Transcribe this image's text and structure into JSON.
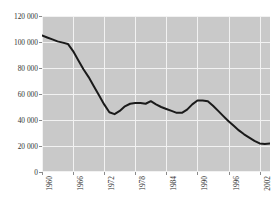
{
  "chart_data": {
    "type": "line",
    "title": "",
    "subtitle": "",
    "xlabel": "",
    "ylabel": "",
    "xlim": [
      1960,
      2004
    ],
    "ylim": [
      0,
      120000
    ],
    "grid": true,
    "legend": null,
    "legend_position": "none",
    "y_tick_labels": [
      "120 000",
      "100 000",
      "80 000",
      "60 000",
      "40 000",
      "20 000",
      "0"
    ],
    "y_tick_values": [
      120000,
      100000,
      80000,
      60000,
      40000,
      20000,
      0
    ],
    "x_tick_labels": [
      "1960",
      "1966",
      "1972",
      "1978",
      "1984",
      "1990",
      "1996",
      "2002"
    ],
    "x_tick_values": [
      1960,
      1966,
      1972,
      1978,
      1984,
      1990,
      1996,
      2002
    ],
    "x_tick_rotation": -90,
    "series_name": "",
    "x": [
      1960,
      1961,
      1962,
      1963,
      1964,
      1965,
      1966,
      1967,
      1968,
      1969,
      1970,
      1971,
      1972,
      1973,
      1974,
      1975,
      1976,
      1977,
      1978,
      1979,
      1980,
      1981,
      1982,
      1983,
      1984,
      1985,
      1986,
      1987,
      1988,
      1989,
      1990,
      1991,
      1992,
      1993,
      1994,
      1995,
      1996,
      1997,
      1998,
      1999,
      2000,
      2001,
      2002,
      2003,
      2004
    ],
    "values": [
      105000,
      103500,
      102000,
      100500,
      99500,
      98500,
      93000,
      86000,
      79000,
      73000,
      66000,
      59000,
      52000,
      46000,
      44500,
      47000,
      50500,
      52500,
      53000,
      53000,
      52500,
      54500,
      52000,
      50000,
      48500,
      47000,
      45500,
      45500,
      48000,
      52000,
      55000,
      55000,
      54500,
      51000,
      47000,
      43000,
      39000,
      35500,
      32000,
      29000,
      26500,
      24000,
      22000,
      21500,
      22000
    ],
    "line_color": "#1a1a1a",
    "panel_background": "#c9c9c9",
    "gridline_color": "#f2f2f2",
    "figure_background": "#ffffff"
  }
}
